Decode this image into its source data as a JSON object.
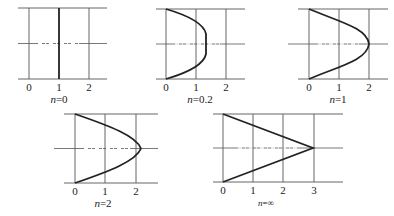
{
  "panels": [
    {
      "id": "n0",
      "label_var": "n",
      "label_value": "=0",
      "ticks": [
        "0",
        "1",
        "2"
      ],
      "profile": "uniform",
      "max_velocity": 1
    },
    {
      "id": "n02",
      "label_var": "n",
      "label_value": "=0.2",
      "ticks": [
        "0",
        "1",
        "2"
      ],
      "profile": "blunted",
      "max_velocity": 1.33
    },
    {
      "id": "n1",
      "label_var": "n",
      "label_value": "=1",
      "ticks": [
        "0",
        "1",
        "2"
      ],
      "profile": "parabolic",
      "max_velocity": 2
    },
    {
      "id": "n2",
      "label_var": "n",
      "label_value": "=2",
      "ticks": [
        "0",
        "1",
        "2"
      ],
      "profile": "pointed",
      "max_velocity": 2.2
    },
    {
      "id": "ninf",
      "label_var": "n",
      "label_value": "=∞",
      "ticks": [
        "0",
        "1",
        "2",
        "3"
      ],
      "profile": "triangular",
      "max_velocity": 3
    }
  ],
  "colors": {
    "line": "#555555",
    "curve": "#222222",
    "background": "#ffffff"
  }
}
